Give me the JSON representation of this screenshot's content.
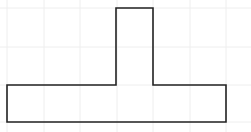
{
  "figure": {
    "background": "#ffffff",
    "grid": {
      "color": "#eeeeee",
      "x_lines": [
        7,
        44,
        80,
        117,
        153,
        190,
        226
      ],
      "y_lines": [
        8,
        47,
        85,
        122
      ]
    },
    "shape": {
      "name": "t-shape",
      "stroke": "#222222",
      "stroke_width": 1.6,
      "points": "116,8 153,8 153,85 226,85 226,122 7,122 7,85 116,85"
    }
  }
}
